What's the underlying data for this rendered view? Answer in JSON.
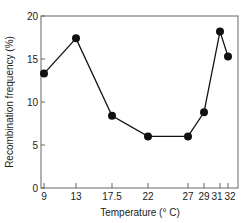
{
  "chart_data": {
    "type": "line",
    "title": "",
    "xlabel": "Temperature (° C)",
    "ylabel": "Recombination frequency (%)",
    "x": [
      9,
      13,
      17.5,
      22,
      27,
      29,
      31,
      32
    ],
    "x_tick_labels": [
      "9",
      "13",
      "17.5",
      "22",
      "27",
      "29",
      "31",
      "32"
    ],
    "y_ticks": [
      0,
      5,
      10,
      15,
      20
    ],
    "y_tick_labels": [
      "0",
      "5",
      "10",
      "15",
      "20"
    ],
    "series": [
      {
        "name": "Recombination frequency",
        "values": [
          13.3,
          17.4,
          8.4,
          6.0,
          6.0,
          8.8,
          18.2,
          15.3
        ]
      }
    ],
    "xlim": [
      8.5,
      33
    ],
    "ylim": [
      0,
      20
    ],
    "grid": false,
    "legend": null,
    "marker": "filled-circle",
    "colors": {
      "line": "#111111",
      "marker": "#111111",
      "frame": "#555555"
    }
  }
}
